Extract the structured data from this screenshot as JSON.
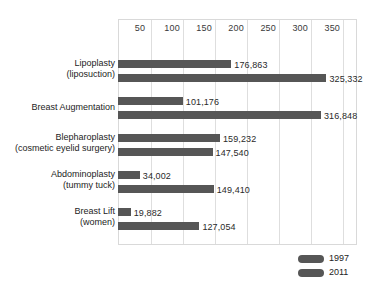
{
  "chart_data": {
    "type": "bar",
    "orientation": "horizontal",
    "title": "",
    "subtitle": "",
    "xlabel": "",
    "ylabel": "",
    "xlim": [
      0,
      373
    ],
    "unit_note": "thousands of procedures",
    "grid": true,
    "legend_position": "bottom-right",
    "xticks": [
      50,
      100,
      150,
      200,
      250,
      300,
      350
    ],
    "xtick_labels": [
      "50",
      "100",
      "150",
      "200",
      "250",
      "300",
      "350"
    ],
    "categories": [
      {
        "line1": "Lipoplasty",
        "line2": "(liposuction)"
      },
      {
        "line1": "Breast Augmentation",
        "line2": ""
      },
      {
        "line1": "Blepharoplasty",
        "line2": "(cosmetic eyelid surgery)"
      },
      {
        "line1": "Abdominoplasty",
        "line2": "(tummy tuck)"
      },
      {
        "line1": "Breast Lift",
        "line2": "(women)"
      }
    ],
    "series": [
      {
        "name": "1997",
        "color": "#565656",
        "values": [
          176.863,
          101.176,
          159.232,
          34.002,
          19.882
        ],
        "labels": [
          "176,863",
          "101,176",
          "159,232",
          "34,002",
          "19,882"
        ]
      },
      {
        "name": "2011",
        "color": "#565656",
        "values": [
          325.332,
          316.848,
          147.54,
          149.41,
          127.054
        ],
        "labels": [
          "325,332",
          "316,848",
          "147,540",
          "149,410",
          "127,054"
        ]
      }
    ]
  },
  "legend": {
    "items": [
      {
        "label": "1997",
        "color": "#565656"
      },
      {
        "label": "2011",
        "color": "#565656"
      }
    ]
  },
  "colors": {
    "bar": "#565656",
    "gridline": "#dedede",
    "frame": "#d9d9d9",
    "text": "#232323",
    "background": "#ffffff"
  }
}
